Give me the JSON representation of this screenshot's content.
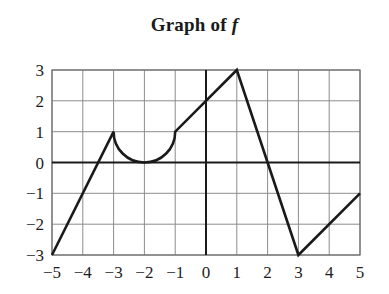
{
  "chart_data": {
    "type": "line",
    "title": "Graph of f",
    "title_prefix": "Graph of ",
    "title_function_symbol": "f",
    "xlabel": "",
    "ylabel": "",
    "xlim": [
      -5,
      5
    ],
    "ylim": [
      -3,
      3
    ],
    "grid": true,
    "legend_position": "none",
    "xticks": [
      -5,
      -4,
      -3,
      -2,
      -1,
      0,
      1,
      2,
      3,
      4,
      5
    ],
    "xtick_labels": [
      "−5",
      "−4",
      "−3",
      "−2",
      "−1",
      "0",
      "1",
      "2",
      "3",
      "4",
      "5"
    ],
    "yticks": [
      -3,
      -2,
      -1,
      0,
      1,
      2,
      3
    ],
    "ytick_labels": [
      "−3",
      "−2",
      "−1",
      "0",
      "1",
      "2",
      "3"
    ],
    "series": [
      {
        "name": "f",
        "color": "#1a1a1a",
        "line_width": 2.6,
        "segments": [
          {
            "kind": "line",
            "description": "linear rise from (-5,-3) to (-3,1)",
            "points": [
              [
                -5,
                -3
              ],
              [
                -3,
                1
              ]
            ]
          },
          {
            "kind": "arc",
            "description": "lower semicircle from (-3,1) to (-1,1) with minimum at (-2,0)",
            "center": [
              -2,
              1
            ],
            "radius": 1,
            "start_point": [
              -3,
              1
            ],
            "end_point": [
              -1,
              1
            ],
            "vertex": [
              -2,
              0
            ],
            "sweep": "downward"
          },
          {
            "kind": "line",
            "description": "linear rise from (-1,1) to (1,3)",
            "points": [
              [
                -1,
                1
              ],
              [
                1,
                3
              ]
            ]
          },
          {
            "kind": "line",
            "description": "linear fall from (1,3) to (3,-3)",
            "points": [
              [
                1,
                3
              ],
              [
                3,
                -3
              ]
            ]
          },
          {
            "kind": "line",
            "description": "linear rise from (3,-3) to (5,-1)",
            "points": [
              [
                3,
                -3
              ],
              [
                5,
                -1
              ]
            ]
          }
        ],
        "key_points": [
          [
            -5,
            -3
          ],
          [
            -4,
            -1
          ],
          [
            -3,
            1
          ],
          [
            -2,
            0
          ],
          [
            -1,
            1
          ],
          [
            0,
            2
          ],
          [
            1,
            3
          ],
          [
            2,
            0
          ],
          [
            3,
            -3
          ],
          [
            4,
            -2
          ],
          [
            5,
            -1
          ]
        ]
      }
    ],
    "axes_style": {
      "gridline_color": "#8c8c8c",
      "axis_line_color": "#1a1a1a",
      "border_color": "#6e6e6e",
      "background": "#ffffff"
    }
  },
  "accessibility": {
    "plot_area_name": "function-graph-plot-area"
  }
}
